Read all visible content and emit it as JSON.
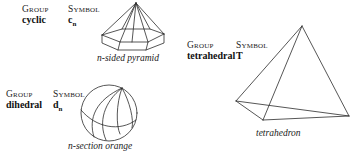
{
  "page": {
    "background_color": "#ffffff",
    "ink_color": "#2b2b2b"
  },
  "entries": [
    {
      "id": "cyclic",
      "group_header": "Group",
      "symbol_header": "Symbol",
      "group_name": "cyclic",
      "symbol_letter": "c",
      "symbol_subscript": "n",
      "figure_name": "n-sided-pyramid-figure",
      "caption": "n-sided pyramid"
    },
    {
      "id": "dihedral",
      "group_header": "Group",
      "symbol_header": "Symbol",
      "group_name": "dihedral",
      "symbol_letter": "d",
      "symbol_subscript": "n",
      "figure_name": "n-section-orange-figure",
      "caption": "n-section orange"
    },
    {
      "id": "tetrahedral",
      "group_header": "Group",
      "symbol_header": "Symbol",
      "group_name": "tetrahedral",
      "symbol_letter": "T",
      "symbol_subscript": "",
      "figure_name": "tetrahedron-figure",
      "caption": "tetrahedron"
    }
  ]
}
